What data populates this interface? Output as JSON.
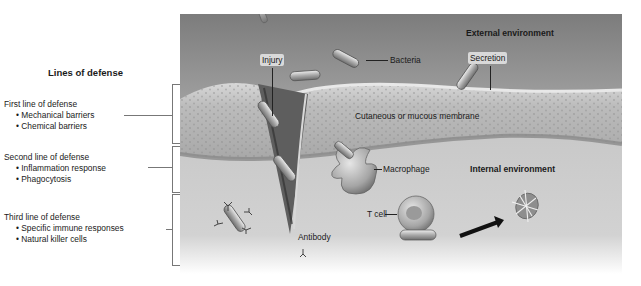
{
  "legend": {
    "title": "Lines of defense",
    "groups": [
      {
        "heading": "First line of defense",
        "items": [
          "Mechanical barriers",
          "Chemical barriers"
        ]
      },
      {
        "heading": "Second line of defense",
        "items": [
          "Inflammation response",
          "Phagocytosis"
        ]
      },
      {
        "heading": "Third line of defense",
        "items": [
          "Specific immune responses",
          "Natural killer cells"
        ]
      }
    ]
  },
  "illustration": {
    "labels": {
      "external": "External environment",
      "internal": "Internal environment",
      "injury": "Injury",
      "bacteria": "Bacteria",
      "secretion": "Secretion",
      "membrane": "Cutaneous or mucous membrane",
      "macrophage": "Macrophage",
      "tcell": "T cell",
      "antibody": "Antibody"
    },
    "colors": {
      "external_bg": "#8e8e8e",
      "membrane": "#b9b9b9",
      "internal_bg": "#c8c8c8",
      "text": "#1a1a1a"
    }
  }
}
